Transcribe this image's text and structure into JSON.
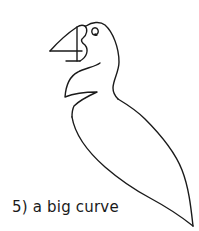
{
  "illustration": {
    "subject": "puffin line drawing",
    "stroke_color": "#1a1a1a",
    "background": "#ffffff"
  },
  "caption": {
    "line1": "5) a big curve",
    "line2": "on the bottom..."
  }
}
